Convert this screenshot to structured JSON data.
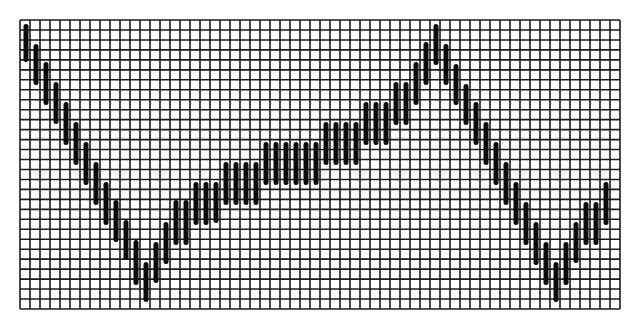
{
  "chart_data": {
    "type": "bar",
    "subtype": "range-bar (floating vertical bars on a grid)",
    "title": "",
    "xlabel": "",
    "ylabel": "",
    "grid": true,
    "legend": null,
    "grid_box": {
      "x0": 20,
      "y0": 20,
      "x1": 620,
      "y1": 309,
      "cols": 60,
      "rows": 29
    },
    "colors": {
      "grid": "#1a1a1a",
      "bar": "#0a0a0a",
      "background": "#ffffff"
    },
    "bar_positions_px_note": "bars placed at x = 26 + 10*i; values are pixel y ranges (top, bottom) within the image",
    "bars": [
      [
        24,
        62
      ],
      [
        44,
        85
      ],
      [
        62,
        105
      ],
      [
        82,
        124
      ],
      [
        102,
        145
      ],
      [
        122,
        165
      ],
      [
        142,
        185
      ],
      [
        162,
        205
      ],
      [
        182,
        225
      ],
      [
        200,
        242
      ],
      [
        220,
        260
      ],
      [
        240,
        285
      ],
      [
        262,
        302
      ],
      [
        242,
        283
      ],
      [
        222,
        264
      ],
      [
        200,
        245
      ],
      [
        200,
        245
      ],
      [
        182,
        225
      ],
      [
        182,
        225
      ],
      [
        182,
        223
      ],
      [
        162,
        205
      ],
      [
        162,
        205
      ],
      [
        162,
        205
      ],
      [
        162,
        205
      ],
      [
        142,
        185
      ],
      [
        142,
        185
      ],
      [
        142,
        185
      ],
      [
        142,
        185
      ],
      [
        142,
        185
      ],
      [
        142,
        185
      ],
      [
        122,
        165
      ],
      [
        122,
        165
      ],
      [
        122,
        165
      ],
      [
        122,
        165
      ],
      [
        102,
        145
      ],
      [
        102,
        145
      ],
      [
        102,
        145
      ],
      [
        82,
        125
      ],
      [
        82,
        125
      ],
      [
        62,
        105
      ],
      [
        42,
        85
      ],
      [
        24,
        65
      ],
      [
        44,
        85
      ],
      [
        64,
        105
      ],
      [
        84,
        125
      ],
      [
        102,
        145
      ],
      [
        122,
        165
      ],
      [
        142,
        185
      ],
      [
        162,
        205
      ],
      [
        182,
        225
      ],
      [
        202,
        245
      ],
      [
        222,
        265
      ],
      [
        242,
        285
      ],
      [
        262,
        302
      ],
      [
        242,
        285
      ],
      [
        222,
        263
      ],
      [
        202,
        245
      ],
      [
        202,
        245
      ],
      [
        182,
        225
      ]
    ]
  }
}
